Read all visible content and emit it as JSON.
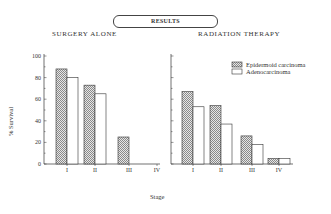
{
  "header": {
    "title": "RESULTS"
  },
  "panels": [
    {
      "title": "SURGERY ALONE"
    },
    {
      "title": "RADIATION THERAPY"
    }
  ],
  "axes": {
    "ylabel": "% Survival",
    "xlabel": "Stage",
    "yticks": [
      "0",
      "20",
      "40",
      "60",
      "80",
      "100"
    ],
    "xticks": [
      "I",
      "II",
      "III",
      "IV"
    ]
  },
  "legend": {
    "items": [
      {
        "label": "Epidermoid carcinoma",
        "pattern": "hatched"
      },
      {
        "label": "Adenocarcinoma",
        "pattern": "white"
      }
    ]
  },
  "colors": {
    "ink": "#333333",
    "hatch": "#9a9a9a",
    "background": "#ffffff"
  },
  "chart_data": [
    {
      "type": "bar",
      "title": "SURGERY ALONE",
      "xlabel": "Stage",
      "ylabel": "% Survival",
      "ylim": [
        0,
        100
      ],
      "categories": [
        "I",
        "II",
        "III",
        "IV"
      ],
      "series": [
        {
          "name": "Epidermoid carcinoma",
          "values": [
            88,
            73,
            25,
            null
          ]
        },
        {
          "name": "Adenocarcinoma",
          "values": [
            80,
            65,
            null,
            null
          ]
        }
      ],
      "grid": false,
      "legend_position": "none"
    },
    {
      "type": "bar",
      "title": "RADIATION THERAPY",
      "xlabel": "Stage",
      "ylabel": "% Survival",
      "ylim": [
        0,
        100
      ],
      "categories": [
        "I",
        "II",
        "III",
        "IV"
      ],
      "series": [
        {
          "name": "Epidermoid carcinoma",
          "values": [
            67,
            54,
            26,
            5
          ]
        },
        {
          "name": "Adenocarcinoma",
          "values": [
            53,
            37,
            18,
            5
          ]
        }
      ],
      "grid": false,
      "legend_position": "upper right"
    }
  ]
}
